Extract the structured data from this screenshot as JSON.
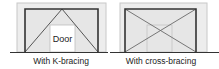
{
  "panels": [
    {
      "id": "k-bracing",
      "caption": "With K-bracing",
      "door_label": "Door",
      "bracing": "K"
    },
    {
      "id": "cross-bracing",
      "caption": "With cross-bracing",
      "door_label": "",
      "bracing": "X"
    }
  ],
  "colors": {
    "outer_fill": "#ededed",
    "outer_stroke": "#c8c8c8",
    "frame_stroke": "#333333",
    "inner_fill": "#e6e6e6",
    "door_fill": "#ffffff",
    "brace_stroke": "#555555",
    "ground_stroke": "#333333",
    "faint_door_stroke": "#c4c4c4"
  }
}
